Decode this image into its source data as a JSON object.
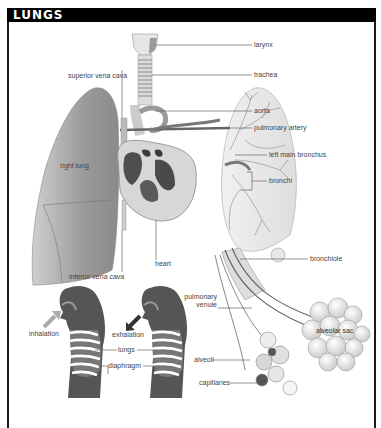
{
  "title": "LUNGS",
  "colors": {
    "title_bar": "#000000",
    "title_text": "#ffffff",
    "label_text": "#444444",
    "leader_line": "#666666",
    "lung_tissue": "#9a9a9a",
    "heart_dark": "#6a6a6a",
    "figure_silhouette": "#555555"
  },
  "labels": {
    "larynx": "larynx",
    "trachea": "trachea",
    "aorta": "aorta",
    "pulmonary_artery": "pulmonary artery",
    "left_main_bronchus": "left main bronchus",
    "bronchi": "bronchi",
    "superior_vena_cava": "superior vena cava",
    "right_lung": "right lung",
    "inferior_vena_cava": "inferior vena cava",
    "heart": "heart",
    "bronchiole": "bronchiole",
    "pulmonary_venule_line1": "pulmonary",
    "pulmonary_venule_line2": "venule",
    "alveolar_sac": "alveolar sac",
    "alveoli": "alveoli",
    "capillaries": "capillaries",
    "inhalation": "inhalation",
    "exhalation": "exhalation",
    "lungs": "lungs",
    "diaphragm": "diaphragm"
  },
  "icons": {
    "inhalation_arrow": "arrow-right-in",
    "exhalation_arrow": "arrow-left-out"
  }
}
